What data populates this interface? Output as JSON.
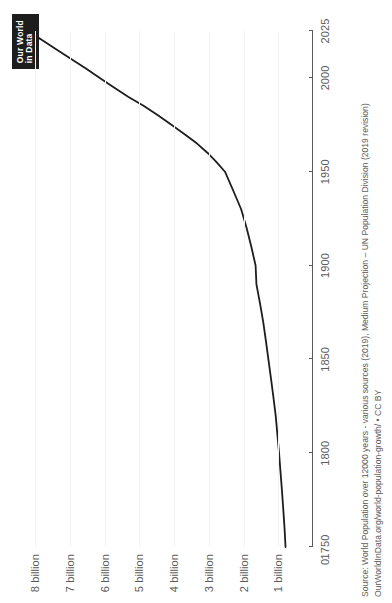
{
  "branding": {
    "logo_line1": "Our World",
    "logo_line2": "in Data",
    "logo_bg": "#1d1d1d",
    "logo_fg": "#ffffff"
  },
  "footer": {
    "source_line": "Source: World Population over 12000 years - various sources (2019), Medium Projection – UN Population Division (2019 revision)",
    "license_line": "OurWorldInData.org/world-population-growth/ • CC BY"
  },
  "chart_data": {
    "type": "line",
    "title": "",
    "subtitle": "",
    "xlabel": "",
    "ylabel": "",
    "xlim": [
      1750,
      2025
    ],
    "ylim": [
      0,
      8500000000
    ],
    "grid": true,
    "legend": false,
    "line_color": "#1d1d1d",
    "grid_color": "#f2f2f2",
    "axis_color": "#5b5b5b",
    "x_ticks": [
      1750,
      1800,
      1850,
      1900,
      1950,
      2000,
      2025
    ],
    "x_tick_labels": [
      "1750",
      "1800",
      "1850",
      "1900",
      "1950",
      "2000",
      "2025"
    ],
    "origin_label": "0",
    "y_ticks": [
      1000000000,
      2000000000,
      3000000000,
      4000000000,
      5000000000,
      6000000000,
      7000000000,
      8000000000
    ],
    "y_tick_labels": [
      "1 billion",
      "2 billion",
      "3 billion",
      "4 billion",
      "5 billion",
      "6 billion",
      "7 billion",
      "8 billion"
    ],
    "projection_start_year": 2021,
    "series": [
      {
        "name": "World Population",
        "x": [
          1750,
          1760,
          1770,
          1780,
          1790,
          1800,
          1810,
          1820,
          1830,
          1840,
          1850,
          1860,
          1870,
          1880,
          1890,
          1900,
          1910,
          1920,
          1930,
          1940,
          1950,
          1955,
          1960,
          1965,
          1970,
          1975,
          1980,
          1985,
          1990,
          1995,
          2000,
          2005,
          2010,
          2015,
          2021
        ],
        "values": [
          791000000,
          820000000,
          856000000,
          894000000,
          936000000,
          978000000,
          1026000000,
          1075000000,
          1142000000,
          1212000000,
          1285000000,
          1358000000,
          1435000000,
          1528000000,
          1630000000,
          1654000000,
          1777000000,
          1912000000,
          2070000000,
          2300000000,
          2536000000,
          2773000000,
          3035000000,
          3340000000,
          3700000000,
          4079000000,
          4458000000,
          4871000000,
          5327000000,
          5744000000,
          6143000000,
          6542000000,
          6957000000,
          7380000000,
          7875000000
        ]
      },
      {
        "name": "Projection",
        "x": [
          2021,
          2025
        ],
        "values": [
          7875000000,
          8184000000
        ]
      }
    ]
  }
}
